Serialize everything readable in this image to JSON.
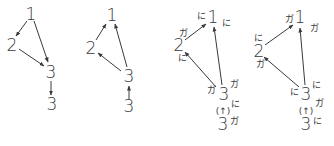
{
  "colors": {
    "ink": "#3a3a3a",
    "background": "#ffffff"
  },
  "diagrams": [
    {
      "id": "d1",
      "nodes": [
        {
          "label": "1",
          "x": 31,
          "y": 14
        },
        {
          "label": "2",
          "x": 12,
          "y": 45
        },
        {
          "label": "3",
          "x": 51,
          "y": 72
        },
        {
          "label": "3",
          "x": 52,
          "y": 104
        }
      ],
      "edges": [
        {
          "from": "1",
          "to": "2"
        },
        {
          "from": "1",
          "to": "3"
        },
        {
          "from": "2",
          "to": "3"
        },
        {
          "from": "3",
          "to": "3 (lower)"
        }
      ]
    },
    {
      "id": "d2",
      "nodes": [
        {
          "label": "1",
          "x": 112,
          "y": 15
        },
        {
          "label": "2",
          "x": 91,
          "y": 48
        },
        {
          "label": "3",
          "x": 129,
          "y": 76
        },
        {
          "label": "3",
          "x": 129,
          "y": 106
        }
      ],
      "edges": [
        {
          "from": "2",
          "to": "1"
        },
        {
          "from": "3",
          "to": "1"
        },
        {
          "from": "3",
          "to": "2"
        },
        {
          "from": "3 (lower)",
          "to": "3"
        }
      ]
    },
    {
      "id": "d3",
      "nodes": [
        {
          "label": "1",
          "x": 213,
          "y": 17
        },
        {
          "label": "2",
          "x": 179,
          "y": 45
        },
        {
          "label": "3",
          "x": 224,
          "y": 94
        },
        {
          "label": "3",
          "x": 223,
          "y": 124
        }
      ],
      "annotations": [
        {
          "text": "に",
          "x": 201,
          "y": 16
        },
        {
          "text": "に",
          "x": 226,
          "y": 23
        },
        {
          "text": "ガ",
          "x": 183,
          "y": 33
        },
        {
          "text": "に",
          "x": 182,
          "y": 58
        },
        {
          "text": "ガ",
          "x": 211,
          "y": 90
        },
        {
          "text": "ガ",
          "x": 234,
          "y": 84
        },
        {
          "text": "に",
          "x": 235,
          "y": 104
        },
        {
          "text": "ガ",
          "x": 234,
          "y": 121
        }
      ],
      "paren_arrow": {
        "text": "(↑)",
        "x": 223,
        "y": 111
      },
      "edges": [
        {
          "from": "2",
          "to": "1"
        },
        {
          "from": "3",
          "to": "1"
        },
        {
          "from": "3",
          "to": "2"
        }
      ]
    },
    {
      "id": "d4",
      "nodes": [
        {
          "label": "1",
          "x": 300,
          "y": 17
        },
        {
          "label": "2",
          "x": 259,
          "y": 51
        },
        {
          "label": "3",
          "x": 306,
          "y": 94
        },
        {
          "label": "3",
          "x": 306,
          "y": 124
        }
      ],
      "annotations": [
        {
          "text": "ガ",
          "x": 289,
          "y": 19
        },
        {
          "text": "ガ",
          "x": 314,
          "y": 28
        },
        {
          "text": "に",
          "x": 258,
          "y": 38
        },
        {
          "text": "ガ",
          "x": 260,
          "y": 64
        },
        {
          "text": "に",
          "x": 294,
          "y": 92
        },
        {
          "text": "に",
          "x": 316,
          "y": 85
        },
        {
          "text": "ガ",
          "x": 319,
          "y": 103
        },
        {
          "text": "に",
          "x": 317,
          "y": 121
        }
      ],
      "paren_arrow": {
        "text": "(↑)",
        "x": 306,
        "y": 111
      },
      "edges": [
        {
          "from": "2",
          "to": "1"
        },
        {
          "from": "3",
          "to": "1"
        },
        {
          "from": "3",
          "to": "2"
        }
      ]
    }
  ],
  "labels": {
    "d1_n1": "1",
    "d1_n2": "2",
    "d1_n3": "3",
    "d1_n3b": "3",
    "d2_n1": "1",
    "d2_n2": "2",
    "d2_n3": "3",
    "d2_n3b": "3",
    "d3_n1": "1",
    "d3_n2": "2",
    "d3_n3": "3",
    "d3_n3b": "3",
    "d4_n1": "1",
    "d4_n2": "2",
    "d4_n3": "3",
    "d4_n3b": "3",
    "ni": "に",
    "ga": "ガ",
    "paren_up": "(↑)"
  }
}
